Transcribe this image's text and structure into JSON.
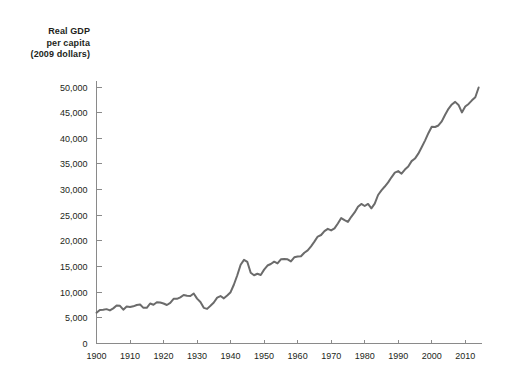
{
  "axis_title": {
    "line1": "Real GDP",
    "line2": "per capita",
    "line3": "(2009 dollars)"
  },
  "chart_data": {
    "type": "line",
    "title": "",
    "subtitle": "",
    "xlabel": "",
    "ylabel": "Real GDP per capita (2009 dollars)",
    "grid": false,
    "legend": false,
    "line_color": "#6b6b6b",
    "axis_color": "#8a8a8a",
    "background_color": "#ffffff",
    "xlim": [
      1900,
      2015
    ],
    "ylim": [
      0,
      52000
    ],
    "xticks": [
      1900,
      1910,
      1920,
      1930,
      1940,
      1950,
      1960,
      1970,
      1980,
      1990,
      2000,
      2010
    ],
    "xtick_labels": [
      "1900",
      "1910",
      "1920",
      "1930",
      "1940",
      "1950",
      "1960",
      "1970",
      "1980",
      "1990",
      "2000",
      "2010"
    ],
    "yticks": [
      0,
      5000,
      10000,
      15000,
      20000,
      25000,
      30000,
      35000,
      40000,
      45000,
      50000
    ],
    "ytick_labels": [
      "0",
      "5,000",
      "10,000",
      "15,000",
      "20,000",
      "25,000",
      "30,000",
      "35,000",
      "40,000",
      "45,000",
      "50,000"
    ],
    "series": [
      {
        "name": "Real GDP per capita",
        "x": [
          1900,
          1901,
          1902,
          1903,
          1904,
          1905,
          1906,
          1907,
          1908,
          1909,
          1910,
          1911,
          1912,
          1913,
          1914,
          1915,
          1916,
          1917,
          1918,
          1919,
          1920,
          1921,
          1922,
          1923,
          1924,
          1925,
          1926,
          1927,
          1928,
          1929,
          1930,
          1931,
          1932,
          1933,
          1934,
          1935,
          1936,
          1937,
          1938,
          1939,
          1940,
          1941,
          1942,
          1943,
          1944,
          1945,
          1946,
          1947,
          1948,
          1949,
          1950,
          1951,
          1952,
          1953,
          1954,
          1955,
          1956,
          1957,
          1958,
          1959,
          1960,
          1961,
          1962,
          1963,
          1964,
          1965,
          1966,
          1967,
          1968,
          1969,
          1970,
          1971,
          1972,
          1973,
          1974,
          1975,
          1976,
          1977,
          1978,
          1979,
          1980,
          1981,
          1982,
          1983,
          1984,
          1985,
          1986,
          1987,
          1988,
          1989,
          1990,
          1991,
          1992,
          1993,
          1994,
          1995,
          1996,
          1997,
          1998,
          1999,
          2000,
          2001,
          2002,
          2003,
          2004,
          2005,
          2006,
          2007,
          2008,
          2009,
          2010,
          2011,
          2012,
          2013,
          2014
        ],
        "values": [
          6000,
          6550,
          6600,
          6700,
          6450,
          6850,
          7400,
          7350,
          6600,
          7200,
          7100,
          7250,
          7500,
          7600,
          6950,
          6950,
          7800,
          7550,
          8050,
          8000,
          7800,
          7500,
          7900,
          8700,
          8700,
          9000,
          9450,
          9300,
          9250,
          9750,
          8750,
          8100,
          6950,
          6750,
          7350,
          8000,
          8950,
          9250,
          8800,
          9350,
          10000,
          11500,
          13300,
          15350,
          16300,
          15900,
          13800,
          13300,
          13600,
          13350,
          14400,
          15200,
          15500,
          15950,
          15600,
          16400,
          16450,
          16400,
          16000,
          16800,
          16950,
          17000,
          17700,
          18150,
          18950,
          19850,
          20850,
          21150,
          21900,
          22350,
          22050,
          22450,
          23400,
          24450,
          24050,
          23700,
          24700,
          25550,
          26650,
          27200,
          26800,
          27200,
          26350,
          27250,
          28950,
          29850,
          30600,
          31400,
          32400,
          33300,
          33600,
          33100,
          33900,
          34500,
          35550,
          36050,
          37000,
          38250,
          39550,
          41000,
          42250,
          42200,
          42500,
          43300,
          44600,
          45750,
          46600,
          47100,
          46500,
          45050,
          46200,
          46700,
          47400,
          48000,
          49900
        ]
      }
    ],
    "annotations": []
  }
}
